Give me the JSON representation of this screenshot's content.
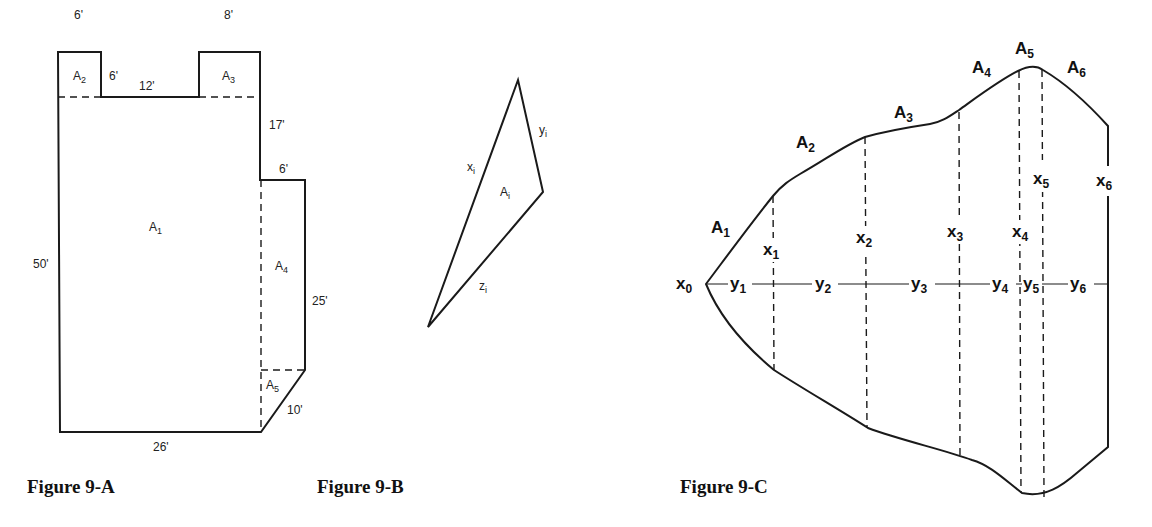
{
  "figures": [
    {
      "caption": "Figure 9-A",
      "areas": {
        "a1": "A",
        "a1_sub": "1",
        "a2": "A",
        "a2_sub": "2",
        "a3": "A",
        "a3_sub": "3",
        "a4": "A",
        "a4_sub": "4",
        "a5": "A",
        "a5_sub": "5"
      },
      "dimensions": {
        "top_left_width": "6'",
        "notch_depth": "6'",
        "notch_width": "12'",
        "top_right_width": "8'",
        "right_upper_height": "17'",
        "step_width": "6'",
        "left_height": "50'",
        "right_lower_height": "25'",
        "diagonal": "10'",
        "bottom_width": "26'"
      }
    },
    {
      "caption": "Figure 9-B",
      "labels": {
        "x": "x",
        "x_sub": "i",
        "y": "y",
        "y_sub": "i",
        "z": "z",
        "z_sub": "i",
        "a": "A",
        "a_sub": "i"
      }
    },
    {
      "caption": "Figure 9-C",
      "areas": [
        {
          "l": "A",
          "s": "1"
        },
        {
          "l": "A",
          "s": "2"
        },
        {
          "l": "A",
          "s": "3"
        },
        {
          "l": "A",
          "s": "4"
        },
        {
          "l": "A",
          "s": "5"
        },
        {
          "l": "A",
          "s": "6"
        }
      ],
      "offsets": [
        {
          "l": "x",
          "s": "0"
        },
        {
          "l": "x",
          "s": "1"
        },
        {
          "l": "x",
          "s": "2"
        },
        {
          "l": "x",
          "s": "3"
        },
        {
          "l": "x",
          "s": "4"
        },
        {
          "l": "x",
          "s": "5"
        },
        {
          "l": "x",
          "s": "6"
        }
      ],
      "intervals": [
        {
          "l": "y",
          "s": "1"
        },
        {
          "l": "y",
          "s": "2"
        },
        {
          "l": "y",
          "s": "3"
        },
        {
          "l": "y",
          "s": "4"
        },
        {
          "l": "y",
          "s": "5"
        },
        {
          "l": "y",
          "s": "6"
        }
      ]
    }
  ]
}
